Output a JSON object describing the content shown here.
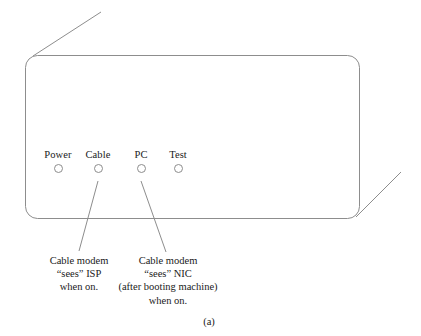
{
  "figure": {
    "caption": "(a)",
    "device": {
      "name": "cable-modem-front-panel",
      "outline_color": "#8d8d8d"
    },
    "leds": [
      {
        "label": "Power",
        "state": "off"
      },
      {
        "label": "Cable",
        "state": "off"
      },
      {
        "label": "PC",
        "state": "off"
      },
      {
        "label": "Test",
        "state": "off"
      }
    ],
    "annotations": [
      {
        "target": "Cable",
        "lines": [
          "Cable modem",
          "“sees” ISP",
          "when on."
        ]
      },
      {
        "target": "PC",
        "lines": [
          "Cable modem",
          "“sees” NIC",
          "(after booting machine)",
          "when on."
        ]
      }
    ]
  }
}
